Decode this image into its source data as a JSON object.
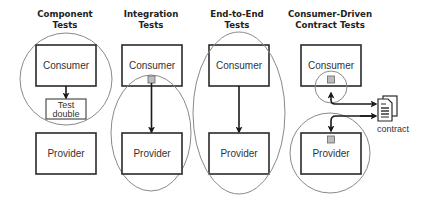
{
  "columns": [
    {
      "id": "component",
      "title_lines": [
        "Component",
        "Tests"
      ],
      "consumer_label": "Consumer",
      "double_label_lines": [
        "Test",
        "double"
      ],
      "provider_label": "Provider",
      "scope": "circle around consumer and test double"
    },
    {
      "id": "integration",
      "title_lines": [
        "Integration",
        "Tests"
      ],
      "consumer_label": "Consumer",
      "provider_label": "Provider",
      "scope": "ellipse around consumer port and provider"
    },
    {
      "id": "end-to-end",
      "title_lines": [
        "End-to-End",
        "Tests"
      ],
      "consumer_label": "Consumer",
      "provider_label": "Provider",
      "scope": "ellipse around consumer and provider"
    },
    {
      "id": "consumer-driven-contract",
      "title_lines": [
        "Consumer-Driven",
        "Contract Tests"
      ],
      "consumer_label": "Consumer",
      "provider_label": "Provider",
      "artifact_label": "contract",
      "scope": "small circle around consumer port; circle around provider"
    }
  ],
  "icons": {
    "contract": "document-stack-icon"
  },
  "colors": {
    "box_stroke": "#2a2a2a",
    "scope_stroke": "#8a8a8a",
    "port_fill": "#bdbdbd",
    "text": "#333333"
  }
}
